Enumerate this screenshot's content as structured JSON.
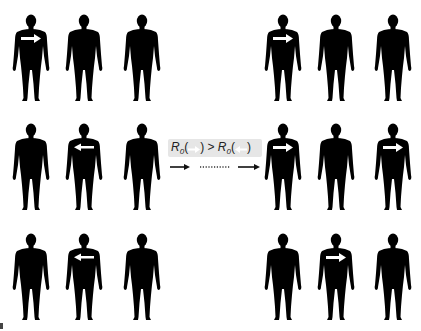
{
  "diagram": {
    "title": "",
    "formula": {
      "symbol": "R",
      "subscript": "0",
      "comparison": ">",
      "left_paren_open": "(",
      "left_paren_close": ")",
      "right_paren_open": "(",
      "right_paren_close": ")",
      "left_icon": "right-arrow-icon",
      "right_icon": "left-arrow-icon"
    },
    "transition": {
      "left_arrow": "solid-right-arrow",
      "middle": "dotted-line",
      "right_arrow": "solid-right-arrow"
    },
    "colors": {
      "silhouette": "#000000",
      "marker": "#ffffff",
      "formula_background": "#e6e6e6",
      "background": "#ffffff"
    },
    "left_panel": {
      "label": "before",
      "figures": [
        {
          "row": 0,
          "col": 0,
          "marker": "right-arrow"
        },
        {
          "row": 0,
          "col": 1,
          "marker": "none"
        },
        {
          "row": 0,
          "col": 2,
          "marker": "none"
        },
        {
          "row": 1,
          "col": 0,
          "marker": "none"
        },
        {
          "row": 1,
          "col": 1,
          "marker": "left-arrow"
        },
        {
          "row": 1,
          "col": 2,
          "marker": "none"
        },
        {
          "row": 2,
          "col": 0,
          "marker": "none"
        },
        {
          "row": 2,
          "col": 1,
          "marker": "left-arrow"
        },
        {
          "row": 2,
          "col": 2,
          "marker": "none"
        }
      ]
    },
    "right_panel": {
      "label": "after",
      "figures": [
        {
          "row": 0,
          "col": 0,
          "marker": "right-arrow"
        },
        {
          "row": 0,
          "col": 1,
          "marker": "none"
        },
        {
          "row": 0,
          "col": 2,
          "marker": "none"
        },
        {
          "row": 1,
          "col": 0,
          "marker": "right-arrow"
        },
        {
          "row": 1,
          "col": 1,
          "marker": "none"
        },
        {
          "row": 1,
          "col": 2,
          "marker": "right-arrow"
        },
        {
          "row": 2,
          "col": 0,
          "marker": "none"
        },
        {
          "row": 2,
          "col": 1,
          "marker": "right-arrow"
        },
        {
          "row": 2,
          "col": 2,
          "marker": "none"
        }
      ]
    }
  }
}
